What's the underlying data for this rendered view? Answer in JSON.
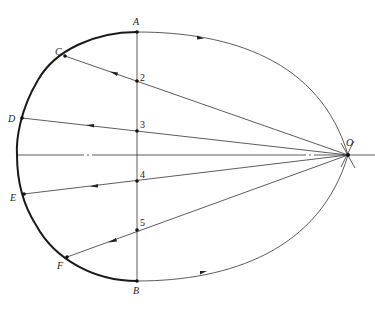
{
  "figure": {
    "type": "geometric construction diagram",
    "colors": {
      "line": "#333333",
      "thick_arc": "#1a1a1a",
      "background": "#ffffff"
    }
  },
  "points": {
    "A": {
      "label": "A",
      "x": 137,
      "y": 32
    },
    "B": {
      "label": "B",
      "x": 137,
      "y": 281
    },
    "C": {
      "label": "C",
      "x": 65,
      "y": 56
    },
    "D": {
      "label": "D",
      "x": 22,
      "y": 118
    },
    "E": {
      "label": "E",
      "x": 24,
      "y": 194
    },
    "F": {
      "label": "F",
      "x": 67,
      "y": 257
    },
    "O": {
      "label": "O",
      "x": 348,
      "y": 155
    },
    "P2": {
      "label": "2",
      "x": 137,
      "y": 81
    },
    "P3": {
      "label": "3",
      "x": 137,
      "y": 131
    },
    "P4": {
      "label": "4",
      "x": 137,
      "y": 181
    },
    "P5": {
      "label": "5",
      "x": 137,
      "y": 230
    }
  },
  "labels": {
    "A": "A",
    "B": "B",
    "C": "C",
    "D": "D",
    "E": "E",
    "F": "F",
    "O": "O",
    "n2": "2",
    "n3": "3",
    "n4": "4",
    "n5": "5"
  },
  "rays": [
    {
      "from": "O",
      "through": "2",
      "to": "C"
    },
    {
      "from": "O",
      "through": "3",
      "to": "D"
    },
    {
      "from": "O",
      "through": "4",
      "to": "E"
    },
    {
      "from": "O",
      "through": "5",
      "to": "F"
    }
  ],
  "arcs": [
    {
      "name": "thick-arc",
      "from": "A",
      "via": [
        "C",
        "D",
        "E",
        "F"
      ],
      "to": "B",
      "weight": "bold"
    },
    {
      "name": "upper-arc",
      "from": "A",
      "to": "O",
      "arrow": "right"
    },
    {
      "name": "lower-arc",
      "from": "B",
      "to": "O",
      "arrow": "right"
    }
  ]
}
